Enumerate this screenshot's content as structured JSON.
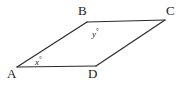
{
  "figure": {
    "kind": "geometry-diagram",
    "shape": "parallelogram",
    "width": 181,
    "height": 86,
    "background_color": "#ffffff",
    "stroke_color": "#2b2b2b",
    "stroke_width": 1.2,
    "vertices": [
      {
        "name": "A",
        "label": "A",
        "x": 17,
        "y": 67
      },
      {
        "name": "B",
        "label": "B",
        "x": 87,
        "y": 22
      },
      {
        "name": "C",
        "label": "C",
        "x": 165,
        "y": 20
      },
      {
        "name": "D",
        "label": "D",
        "x": 96,
        "y": 66
      }
    ],
    "edges": [
      {
        "name": "AB",
        "from": "A",
        "to": "B"
      },
      {
        "name": "BC",
        "from": "B",
        "to": "C"
      },
      {
        "name": "CD",
        "from": "C",
        "to": "D"
      },
      {
        "name": "DA",
        "from": "D",
        "to": "A"
      }
    ],
    "angle_labels": [
      {
        "name": "angle-x-at-A",
        "variable": "x",
        "degree_symbol": "°",
        "at_vertex": "A"
      },
      {
        "name": "angle-y-at-B",
        "variable": "y",
        "degree_symbol": "°",
        "at_vertex": "B"
      }
    ]
  }
}
